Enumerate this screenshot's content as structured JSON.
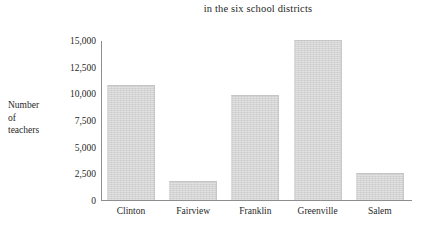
{
  "chart_data": {
    "type": "bar",
    "title": "in the six school districts",
    "xlabel": "",
    "ylabel": "Number of teachers",
    "ylabel_lines": [
      "Number",
      "of",
      "teachers"
    ],
    "categories": [
      "Clinton",
      "Fairview",
      "Franklin",
      "Greenville",
      "Salem"
    ],
    "values": [
      10800,
      1750,
      9800,
      15000,
      2500
    ],
    "series": [
      {
        "name": "Number of teachers",
        "values": [
          10800,
          1750,
          9800,
          15000,
          2500
        ]
      }
    ],
    "ylim": [
      0,
      15000
    ],
    "ytick_values": [
      0,
      2500,
      5000,
      7500,
      10000,
      12500,
      15000
    ],
    "ytick_labels": [
      "0",
      "2,500",
      "5,000",
      "7,500",
      "10,000",
      "12,500",
      "15,000"
    ],
    "grid": false,
    "legend": null,
    "legend_position": "none",
    "bar_color": "#d2d2d2",
    "axis_color": "#8e8e8e",
    "text_color": "#1f1f1f",
    "background_color": "#ffffff"
  }
}
